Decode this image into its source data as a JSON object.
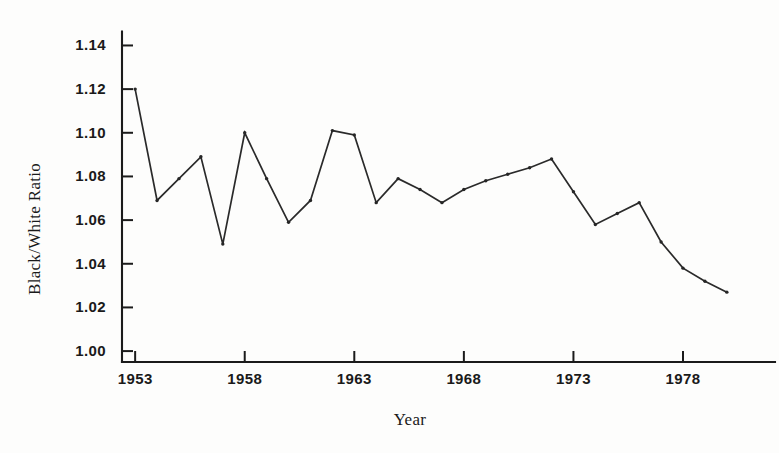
{
  "chart_data": {
    "type": "line",
    "title": "",
    "xlabel": "Year",
    "ylabel": "Black/White Ratio",
    "xlim": [
      1952.4,
      1980.6
    ],
    "ylim": [
      0.995,
      1.148
    ],
    "grid": false,
    "legend": "none",
    "x_tick_labels": [
      "1953",
      "1958",
      "1963",
      "1968",
      "1973",
      "1978"
    ],
    "x_tick_values": [
      1953,
      1958,
      1963,
      1968,
      1973,
      1978
    ],
    "y_tick_labels": [
      "1.00",
      "1.02",
      "1.04",
      "1.06",
      "1.08",
      "1.10",
      "1.12",
      "1.14"
    ],
    "y_tick_values": [
      1.0,
      1.02,
      1.04,
      1.06,
      1.08,
      1.1,
      1.12,
      1.14
    ],
    "x": [
      1953,
      1954,
      1955,
      1956,
      1957,
      1958,
      1959,
      1960,
      1961,
      1962,
      1963,
      1964,
      1965,
      1966,
      1967,
      1968,
      1969,
      1970,
      1971,
      1972,
      1973,
      1974,
      1975,
      1976,
      1977,
      1978,
      1979,
      1980
    ],
    "values": [
      1.12,
      1.069,
      1.079,
      1.089,
      1.049,
      1.1,
      1.079,
      1.059,
      1.069,
      1.101,
      1.099,
      1.068,
      1.079,
      1.074,
      1.068,
      1.074,
      1.078,
      1.081,
      1.084,
      1.088,
      1.073,
      1.058,
      1.063,
      1.068,
      1.05,
      1.038,
      1.032,
      1.027
    ],
    "series": [
      {
        "name": "Black/White Ratio",
        "values": [
          1.12,
          1.069,
          1.079,
          1.089,
          1.049,
          1.1,
          1.079,
          1.059,
          1.069,
          1.101,
          1.099,
          1.068,
          1.079,
          1.074,
          1.068,
          1.074,
          1.078,
          1.081,
          1.084,
          1.088,
          1.073,
          1.058,
          1.063,
          1.068,
          1.05,
          1.038,
          1.032,
          1.027
        ]
      }
    ],
    "line_color": "#2a2a2a",
    "marker": "dot"
  },
  "figure": {
    "background_color": "#fdfdfc",
    "axis_color": "#1b1b1b"
  }
}
